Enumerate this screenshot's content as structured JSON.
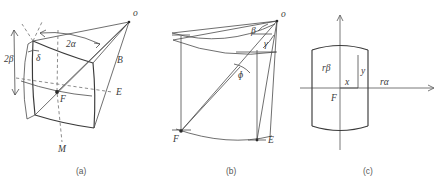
{
  "figure": {
    "background": "#ffffff",
    "line_color": "#4a4a4a",
    "dash_color": "#6e6e6e",
    "text_color": "#3a3a3a",
    "captions": [
      {
        "id": "a",
        "text": "(a)",
        "x": 83,
        "y": 171
      },
      {
        "id": "b",
        "text": "(b)",
        "x": 233,
        "y": 171
      },
      {
        "id": "c",
        "text": "(c)",
        "x": 370,
        "y": 171
      }
    ]
  },
  "panel_a": {
    "name": "three-dimensional-cone-beam-view",
    "labels": [
      {
        "key": "apex",
        "text": "o",
        "x": 133,
        "y": 16,
        "style": "lbl"
      },
      {
        "key": "half_fan",
        "text": "2α",
        "x": 66,
        "y": 47,
        "style": "lbl-greek"
      },
      {
        "key": "half_cone",
        "text": "2β",
        "x": 8,
        "y": 59,
        "style": "lbl-greek"
      },
      {
        "key": "delta",
        "text": "δ",
        "x": 36,
        "y": 61,
        "style": "lbl-greek"
      },
      {
        "key": "focus",
        "text": "F",
        "x": 60,
        "y": 100,
        "style": "lbl"
      },
      {
        "key": "edge_E",
        "text": "E",
        "x": 116,
        "y": 94,
        "style": "lbl"
      },
      {
        "key": "ray_B",
        "text": "B",
        "x": 117,
        "y": 61,
        "style": "lbl"
      },
      {
        "key": "axis_M",
        "text": "M",
        "x": 60,
        "y": 150,
        "style": "lbl"
      }
    ]
  },
  "panel_b": {
    "name": "side-projection-angles-view",
    "labels": [
      {
        "key": "apex",
        "text": "o",
        "x": 281,
        "y": 17,
        "style": "lbl"
      },
      {
        "key": "beta",
        "text": "β",
        "x": 253,
        "y": 33,
        "style": "lbl-greek"
      },
      {
        "key": "gamma",
        "text": "γ",
        "x": 266,
        "y": 45,
        "style": "lbl-greek"
      },
      {
        "key": "phi",
        "text": "ɸ",
        "x": 241,
        "y": 75,
        "style": "lbl-greek"
      },
      {
        "key": "focus",
        "text": "F",
        "x": 176,
        "y": 134,
        "style": "lbl"
      },
      {
        "key": "edge_E",
        "text": "E",
        "x": 262,
        "y": 140,
        "style": "lbl"
      }
    ]
  },
  "panel_c": {
    "name": "flattened-detector-coordinates-view",
    "labels": [
      {
        "key": "r_beta",
        "text": "rβ",
        "x": 325,
        "y": 68,
        "style": "lbl-greek"
      },
      {
        "key": "y_coord",
        "text": "y",
        "x": 358,
        "y": 72,
        "style": "lbl"
      },
      {
        "key": "x_coord",
        "text": "x",
        "x": 343,
        "y": 84,
        "style": "lbl"
      },
      {
        "key": "focus",
        "text": "F",
        "x": 330,
        "y": 99,
        "style": "lbl"
      },
      {
        "key": "r_alpha",
        "text": "rα",
        "x": 383,
        "y": 83,
        "style": "lbl-greek"
      }
    ],
    "axes": {
      "horizontal_y": 88,
      "vertical_x": 340,
      "h_start": 300,
      "h_end": 438,
      "v_start": 150,
      "v_end": 14
    }
  }
}
